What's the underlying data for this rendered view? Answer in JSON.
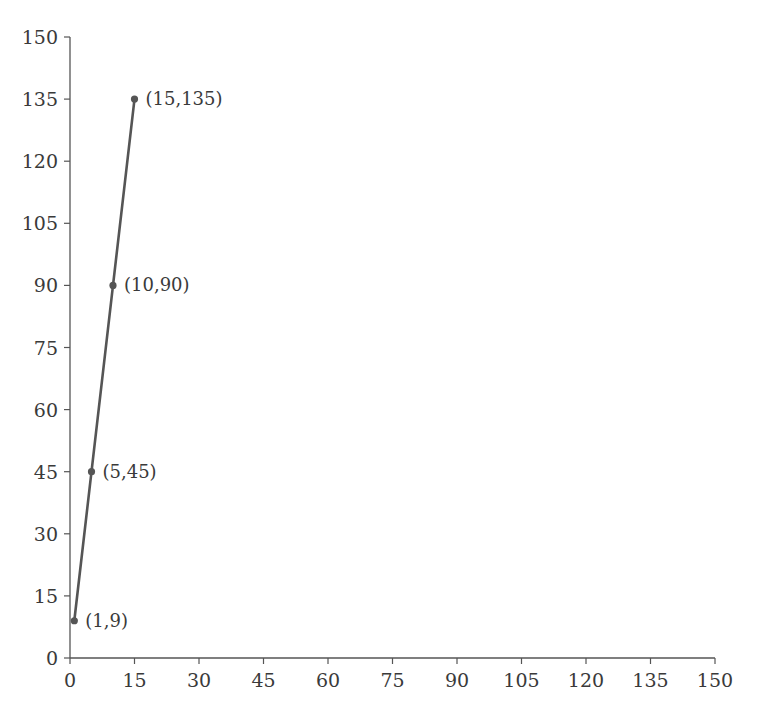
{
  "chart_data": {
    "type": "line",
    "title": "",
    "xlabel": "",
    "ylabel": "",
    "xlim": [
      0,
      150
    ],
    "ylim": [
      0,
      150
    ],
    "grid": false,
    "x_ticks": [
      0,
      15,
      30,
      45,
      60,
      75,
      90,
      105,
      120,
      135,
      150
    ],
    "y_ticks": [
      0,
      15,
      30,
      45,
      60,
      75,
      90,
      105,
      120,
      135,
      150
    ],
    "series": [
      {
        "name": "y = 9x",
        "x": [
          1,
          5,
          10,
          15
        ],
        "y": [
          9,
          45,
          90,
          135
        ],
        "color": "#555555"
      }
    ],
    "annotations": [
      "(1,9)",
      "(5,45)",
      "(10,90)",
      "(15,135)"
    ]
  }
}
